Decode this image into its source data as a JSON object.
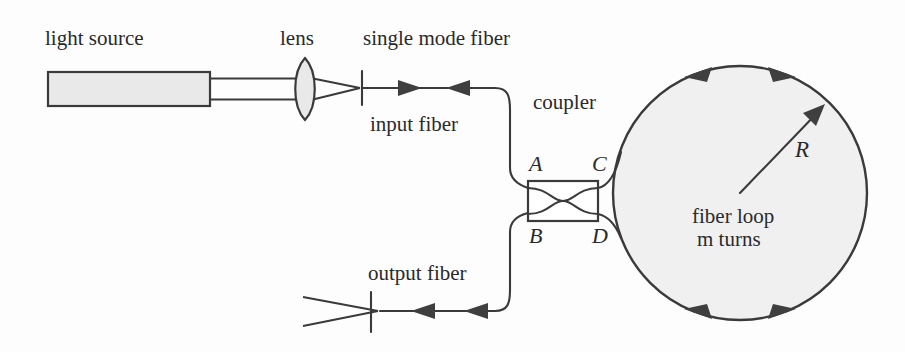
{
  "diagram": {
    "background_color": "#fdfdfd",
    "ink_color": "#3a3a3a",
    "fill_color": "#e9e9e9",
    "labels": {
      "light_source": "light source",
      "lens": "lens",
      "single_mode_fiber": "single mode fiber",
      "input_fiber": "input fiber",
      "coupler": "coupler",
      "output_fiber": "output fiber",
      "fiber_loop_line1": "fiber loop",
      "fiber_loop_line2": "m turns",
      "radius": "R",
      "port_a": "A",
      "port_b": "B",
      "port_c": "C",
      "port_d": "D"
    },
    "components": [
      {
        "name": "light-source-box",
        "kind": "rectangle",
        "fill": "#e9e9e9"
      },
      {
        "name": "lens",
        "kind": "biconvex-lens",
        "fill": "#e9e9e9"
      },
      {
        "name": "coupler-box",
        "kind": "rectangle-with-crossing",
        "fill": "#ffffff"
      },
      {
        "name": "fiber-loop-circle",
        "kind": "circle",
        "fill": "#f0f0f0"
      }
    ],
    "geometry": {
      "loop_center_x": 740,
      "loop_center_y": 193,
      "loop_radius": 127,
      "coupler_x": 528,
      "coupler_y": 181,
      "coupler_width": 70,
      "coupler_height": 40,
      "input_fiber_y": 88,
      "output_fiber_y": 311
    },
    "arrow_markers": {
      "input_fiber_count": 2,
      "output_fiber_count": 2,
      "loop_top_count": 2,
      "loop_bottom_count": 2,
      "radius_arrow": 1
    }
  }
}
